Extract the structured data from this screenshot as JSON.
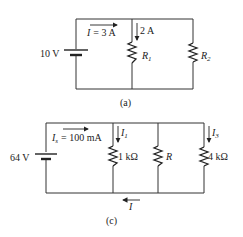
{
  "figures": [
    {
      "caption": "(a)",
      "source": {
        "label": "10 V"
      },
      "current_total": {
        "symbol": "I",
        "eq": "= 3 A"
      },
      "branch_current": {
        "label": "2 A"
      },
      "resistors": [
        {
          "symbol": "R",
          "sub": "1"
        },
        {
          "symbol": "R",
          "sub": "2"
        }
      ]
    },
    {
      "caption": "(c)",
      "source": {
        "label": "64 V"
      },
      "current_source": {
        "symbol": "I",
        "sub": "s",
        "eq": "= 100 mA"
      },
      "branch_currents": [
        {
          "symbol": "I",
          "sub": "1"
        },
        {
          "symbol": "I",
          "sub": "3"
        }
      ],
      "resistors": [
        {
          "label": "1 kΩ"
        },
        {
          "symbol": "R"
        },
        {
          "label": "4 kΩ"
        }
      ],
      "return_current": {
        "symbol": "I"
      }
    }
  ]
}
